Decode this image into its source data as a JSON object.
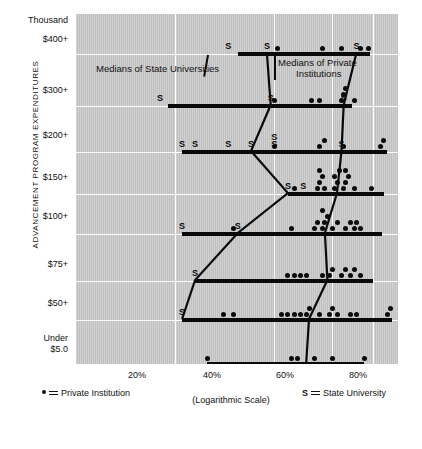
{
  "chart_data": {
    "type": "scatter",
    "title": "",
    "xlabel": "(Logarithmic Scale)",
    "ylabel": "ADVANCEMENT PROGRAM EXPENDITURES",
    "y_unit_label": "Thousand",
    "xlim": [
      10,
      95
    ],
    "xticks": [
      20,
      40,
      60,
      80
    ],
    "xticklabels": [
      "20%",
      "40%",
      "60%",
      "80%"
    ],
    "grid": true,
    "legend": [
      {
        "marker": "dot",
        "symbol": "•",
        "label": "Private Institution"
      },
      {
        "marker": "S",
        "symbol": "S",
        "label": "State University"
      }
    ],
    "annotations": [
      {
        "text": "Medians of State Universities",
        "x": 25,
        "y": 7.4
      },
      {
        "text": "Medians of Private Institutions",
        "x": 66,
        "y": 7.4
      }
    ],
    "categories": [
      "$400+",
      "$300+",
      "$200+",
      "$150+",
      "$100+",
      "$75+",
      "$50+",
      "Under $5.0"
    ],
    "rows": [
      {
        "label": "$400+",
        "bar_range": [
          31,
          78
        ],
        "private_values": [
          41,
          56,
          64,
          73,
          77
        ],
        "state_values": [
          29,
          38,
          71
        ],
        "median_state": 38,
        "median_private": 71
      },
      {
        "label": "$300+",
        "bar_range": [
          19,
          69
        ],
        "private_values": [
          40,
          52,
          55,
          64,
          65,
          66,
          70
        ],
        "state_values": [
          18,
          39,
          65
        ],
        "median_state": 39,
        "median_private": 65
      },
      {
        "label": "$200+",
        "bar_range": [
          21,
          88
        ],
        "private_values": [
          40,
          55,
          57,
          65,
          84,
          86
        ],
        "state_values": [
          21,
          23,
          29,
          34,
          40,
          40,
          64
        ],
        "median_state": 34,
        "median_private": 64
      },
      {
        "label": "$150+",
        "bar_range": [
          44,
          86
        ],
        "private_values": [
          46,
          54,
          55,
          56,
          55,
          57,
          61,
          62,
          61,
          63,
          65,
          66,
          67,
          66,
          70,
          79
        ],
        "state_values": [
          44,
          49
        ],
        "median_state": 44,
        "median_private": 62
      },
      {
        "label": "$100+",
        "bar_range": [
          21,
          85
        ],
        "private_values": [
          30,
          45,
          53,
          54,
          56,
          57,
          58,
          56,
          60,
          62,
          66,
          68,
          70,
          71,
          73
        ],
        "state_values": [
          21,
          31
        ],
        "median_state": 31,
        "median_private": 57
      },
      {
        "label": "$75+",
        "bar_range": [
          23,
          80
        ],
        "private_values": [
          44,
          46,
          48,
          50,
          56,
          59,
          60,
          64,
          66,
          68,
          70,
          73
        ],
        "state_values": [
          23
        ],
        "median_state": 23,
        "median_private": 58
      },
      {
        "label": "$50+",
        "bar_range": [
          21,
          91
        ],
        "private_values": [
          28,
          30,
          42,
          44,
          46,
          48,
          50,
          51,
          55,
          59,
          60,
          62,
          68,
          71,
          88,
          90
        ],
        "state_values": [
          21
        ],
        "median_state": 21,
        "median_private": 51
      },
      {
        "label": "Under $5.0",
        "bar_range": [
          25,
          75
        ],
        "private_values": [
          25,
          45,
          47,
          53,
          60,
          75
        ],
        "state_values": [],
        "median_state": null,
        "median_private": 50
      }
    ],
    "median_state_path": [
      {
        "row": "$400+",
        "x": 38
      },
      {
        "row": "$300+",
        "x": 39
      },
      {
        "row": "$200+",
        "x": 34
      },
      {
        "row": "$150+",
        "x": 44
      },
      {
        "row": "$100+",
        "x": 31
      },
      {
        "row": "$75+",
        "x": 23
      },
      {
        "row": "$50+",
        "x": 21
      }
    ],
    "median_private_path": [
      {
        "row": "$400+",
        "x": 71
      },
      {
        "row": "$300+",
        "x": 65
      },
      {
        "row": "$200+",
        "x": 64
      },
      {
        "row": "$150+",
        "x": 62
      },
      {
        "row": "$100+",
        "x": 57
      },
      {
        "row": "$75+",
        "x": 58
      },
      {
        "row": "$50+",
        "x": 51
      },
      {
        "row": "Under $5.0",
        "x": 50
      }
    ]
  },
  "axis": {
    "y_title": "ADVANCEMENT PROGRAM EXPENDITURES",
    "y_unit": "Thousand",
    "y_labels": [
      "$400+",
      "$300+",
      "$200+",
      "$150+",
      "$100+",
      "$75+",
      "$50+"
    ],
    "y_last_line1": "Under",
    "y_last_line2": "$5.0",
    "x_labels": [
      "20%",
      "40%",
      "60%",
      "80%"
    ],
    "x_caption": "(Logarithmic Scale)"
  },
  "annotations": {
    "state": "Medians of State Universities",
    "private_line1": "Medians of Private",
    "private_line2": "Institutions"
  },
  "legend": {
    "private_label": "Private Institution",
    "state_symbol": "S",
    "state_label": "State University"
  },
  "colors": {
    "plot_background": "#c9c9c9",
    "ink": "#0a0a0a",
    "grid": "#ffffff",
    "page": "#ffffff"
  }
}
